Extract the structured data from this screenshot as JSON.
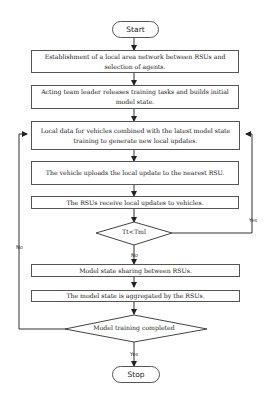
{
  "flowchart": {
    "start": "Start",
    "stop": "Stop",
    "steps": [
      "Establishment of a local area network between RSUs and selection of agents.",
      "Acting team leader releases training tasks and builds initial model state.",
      "Local data for vehicles combined with the latest model state training to generate new local updates.",
      "The vehicle uploads the local update to the nearest RSU.",
      "The RSUs receive local updates to vehicles.",
      "Model state sharing between RSUs.",
      "The model state is aggregated by the RSUs."
    ],
    "decisions": [
      {
        "text": "Tt<Tml",
        "yes": "Yes",
        "no": "No"
      },
      {
        "text": "Model training completed",
        "yes": "Yes",
        "no": "No"
      }
    ]
  }
}
